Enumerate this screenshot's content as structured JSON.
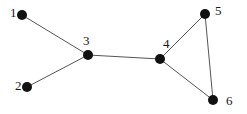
{
  "figure": {
    "kind": "undirected-graph-diagram",
    "width": 247,
    "height": 114,
    "background_color": "#ffffff",
    "node_color": "#111111",
    "edge_color": "#555555",
    "label_color": "#161616",
    "node_radius": 5,
    "edge_width": 1
  },
  "chart_data": {
    "type": "diagram",
    "title": "",
    "xlabel": "",
    "ylabel": "",
    "graph_type": "undirected",
    "node_count": 6,
    "edge_count": 6,
    "nodes": [
      {
        "id": "1",
        "label": "1",
        "cx": 22,
        "cy": 15,
        "label_x": 10,
        "label_y": 6,
        "label_align": "left"
      },
      {
        "id": "2",
        "label": "2",
        "cx": 27,
        "cy": 87,
        "label_x": 15,
        "label_y": 79,
        "label_align": "left"
      },
      {
        "id": "3",
        "label": "3",
        "cx": 88,
        "cy": 55,
        "label_x": 83,
        "label_y": 34,
        "label_align": "left"
      },
      {
        "id": "4",
        "label": "4",
        "cx": 160,
        "cy": 59,
        "label_x": 163,
        "label_y": 37,
        "label_align": "left"
      },
      {
        "id": "5",
        "label": "5",
        "cx": 205,
        "cy": 14,
        "label_x": 215,
        "label_y": 4,
        "label_align": "left"
      },
      {
        "id": "6",
        "label": "6",
        "cx": 213,
        "cy": 100,
        "label_x": 226,
        "label_y": 94,
        "label_align": "left"
      }
    ],
    "edges": [
      {
        "source": "1",
        "target": "3"
      },
      {
        "source": "2",
        "target": "3"
      },
      {
        "source": "3",
        "target": "4"
      },
      {
        "source": "4",
        "target": "5"
      },
      {
        "source": "4",
        "target": "6"
      },
      {
        "source": "5",
        "target": "6"
      }
    ],
    "adjacency": {
      "1": [
        "3"
      ],
      "2": [
        "3"
      ],
      "3": [
        "1",
        "2",
        "4"
      ],
      "4": [
        "3",
        "5",
        "6"
      ],
      "5": [
        "4",
        "6"
      ],
      "6": [
        "4",
        "5"
      ]
    },
    "degrees": {
      "1": 1,
      "2": 1,
      "3": 3,
      "4": 3,
      "5": 2,
      "6": 2
    }
  }
}
